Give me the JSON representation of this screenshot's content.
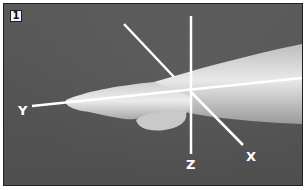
{
  "figure": {
    "number_label": "1",
    "axes": {
      "x_label": "X",
      "y_label": "Y",
      "z_label": "Z"
    },
    "colors": {
      "background": "#555555",
      "axis_lines": "#ffffff",
      "arm": "#d8d8d8"
    }
  }
}
